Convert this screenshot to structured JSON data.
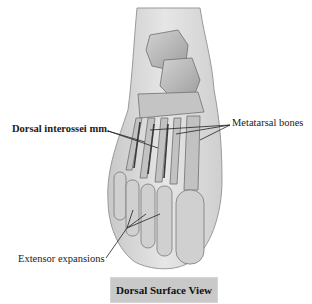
{
  "figure": {
    "labels": {
      "dorsal_interossei": "Dorsal interossei mm.",
      "metatarsal_bones": "Metatarsal bones",
      "extensor_expansions": "Extensor expansions"
    },
    "caption": "Dorsal Surface View"
  },
  "colors": {
    "skin_fill": "#d9d9d9",
    "bone_fill": "#bdbdbd",
    "bone_stroke": "#7a7a7a",
    "leader_line": "#222222",
    "caption_bg": "#c9c9c9"
  }
}
